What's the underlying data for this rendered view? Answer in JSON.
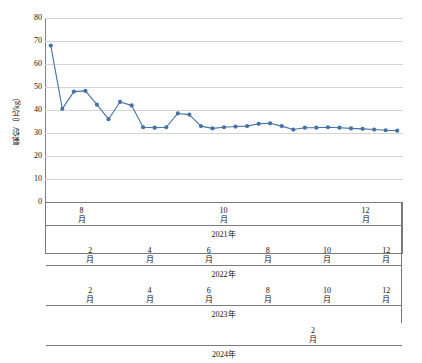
{
  "chart_data": {
    "type": "line",
    "title": "",
    "xlabel": "",
    "ylabel": "氨价/（元/kg）",
    "ylim": [
      0,
      80
    ],
    "ytick_values": [
      80,
      70,
      60,
      50,
      40,
      30,
      20,
      10,
      0
    ],
    "ytick_labels": [
      "80",
      "70",
      "60",
      "50",
      "40",
      "30",
      "20",
      "10",
      "0"
    ],
    "grid": true,
    "legend": "none",
    "series": [
      {
        "name": "氨价",
        "color": "#4472a4",
        "marker": "circle",
        "values": [
          68,
          40.5,
          48,
          48.3,
          42.3,
          36,
          43.5,
          42,
          32.5,
          32.3,
          32.5,
          38.5,
          38,
          33,
          32,
          32.5,
          32.8,
          33,
          34,
          34.2,
          33,
          31.5,
          32.3,
          32.3,
          32.5,
          32.3,
          32,
          31.8,
          31.5,
          31.2,
          31
        ]
      }
    ],
    "x": [
      "2021-08",
      "2021-09",
      "2021-10",
      "2021-11",
      "2021-12",
      "2022-01",
      "2022-02",
      "2022-03",
      "2022-04",
      "2022-05",
      "2022-06",
      "2022-07",
      "2022-08",
      "2022-09",
      "2022-10",
      "2022-11",
      "2022-12",
      "2023-01",
      "2023-02",
      "2023-03",
      "2023-04",
      "2023-05",
      "2023-06",
      "2023-07",
      "2023-08",
      "2023-09",
      "2023-10",
      "2023-11",
      "2023-12",
      "2024-01",
      "2024-02"
    ],
    "x_axis_groups": [
      {
        "year_label": "2021年",
        "months": [
          {
            "num": "8",
            "unit": "月",
            "labeled": true
          },
          {
            "num": "",
            "unit": "",
            "labeled": false
          },
          {
            "num": "10",
            "unit": "月",
            "labeled": true
          },
          {
            "num": "",
            "unit": "",
            "labeled": false
          },
          {
            "num": "12",
            "unit": "月",
            "labeled": true
          }
        ]
      },
      {
        "year_label": "2022年",
        "months": [
          {
            "num": "",
            "unit": "",
            "labeled": false
          },
          {
            "num": "2",
            "unit": "月",
            "labeled": true
          },
          {
            "num": "",
            "unit": "",
            "labeled": false
          },
          {
            "num": "4",
            "unit": "月",
            "labeled": true
          },
          {
            "num": "",
            "unit": "",
            "labeled": false
          },
          {
            "num": "6",
            "unit": "月",
            "labeled": true
          },
          {
            "num": "",
            "unit": "",
            "labeled": false
          },
          {
            "num": "8",
            "unit": "月",
            "labeled": true
          },
          {
            "num": "",
            "unit": "",
            "labeled": false
          },
          {
            "num": "10",
            "unit": "月",
            "labeled": true
          },
          {
            "num": "",
            "unit": "",
            "labeled": false
          },
          {
            "num": "12",
            "unit": "月",
            "labeled": true
          }
        ]
      },
      {
        "year_label": "2023年",
        "months": [
          {
            "num": "",
            "unit": "",
            "labeled": false
          },
          {
            "num": "2",
            "unit": "月",
            "labeled": true
          },
          {
            "num": "",
            "unit": "",
            "labeled": false
          },
          {
            "num": "4",
            "unit": "月",
            "labeled": true
          },
          {
            "num": "",
            "unit": "",
            "labeled": false
          },
          {
            "num": "6",
            "unit": "月",
            "labeled": true
          },
          {
            "num": "",
            "unit": "",
            "labeled": false
          },
          {
            "num": "8",
            "unit": "月",
            "labeled": true
          },
          {
            "num": "",
            "unit": "",
            "labeled": false
          },
          {
            "num": "10",
            "unit": "月",
            "labeled": true
          },
          {
            "num": "",
            "unit": "",
            "labeled": false
          },
          {
            "num": "12",
            "unit": "月",
            "labeled": true
          }
        ]
      },
      {
        "year_label": "2024年",
        "months": [
          {
            "num": "",
            "unit": "",
            "labeled": false
          },
          {
            "num": "2",
            "unit": "月",
            "labeled": true
          }
        ]
      }
    ]
  },
  "colors": {
    "series": "#4472a4",
    "gridline": "#d4d4d4",
    "axis": "#7a7a7a",
    "text": "#111111"
  }
}
